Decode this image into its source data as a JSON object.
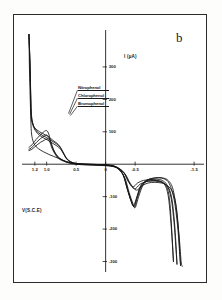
{
  "figure": {
    "panel_letter": "b",
    "caption_x": "V(S.C.E)",
    "caption_y": "I (µA)"
  },
  "legend": {
    "items": [
      {
        "label": "Nitrophenol"
      },
      {
        "label": "Chlorophenol"
      },
      {
        "label": "Bromophenol"
      }
    ]
  },
  "chart_data": {
    "type": "line",
    "title": "b",
    "xlabel": "V(S.C.E)",
    "ylabel": "I (µA)",
    "xlim": [
      1.35,
      -1.6
    ],
    "ylim": [
      -320,
      420
    ],
    "grid": false,
    "legend_position": "inside-left",
    "x_ticks": [
      {
        "value": 1.2,
        "label": "1.2"
      },
      {
        "value": 1.0,
        "label": "1.0"
      },
      {
        "value": 0.5,
        "label": "0.5"
      },
      {
        "value": 0.0,
        "label": "0"
      },
      {
        "value": -0.5,
        "label": "-0.5"
      },
      {
        "value": -1.5,
        "label": "-1.5"
      }
    ],
    "y_ticks": [
      {
        "value": 300,
        "label": "300"
      },
      {
        "value": 200,
        "label": "200"
      },
      {
        "value": 100,
        "label": "100"
      },
      {
        "value": -100,
        "label": "-100"
      },
      {
        "value": -200,
        "label": "-200"
      },
      {
        "value": -300,
        "label": "-300"
      }
    ],
    "series": [
      {
        "name": "Nitrophenol",
        "points": [
          [
            1.3,
            400
          ],
          [
            1.28,
            300
          ],
          [
            1.27,
            215
          ],
          [
            1.26,
            160
          ],
          [
            1.24,
            130
          ],
          [
            1.2,
            112
          ],
          [
            1.12,
            100
          ],
          [
            1.02,
            90
          ],
          [
            0.95,
            82
          ],
          [
            0.88,
            72
          ],
          [
            0.82,
            64
          ],
          [
            0.78,
            56
          ],
          [
            0.74,
            44
          ],
          [
            0.7,
            30
          ],
          [
            0.66,
            18
          ],
          [
            0.6,
            8
          ],
          [
            0.5,
            2
          ],
          [
            0.35,
            0
          ],
          [
            0.15,
            -1
          ],
          [
            0.0,
            -2
          ],
          [
            -0.15,
            -6
          ],
          [
            -0.28,
            -26
          ],
          [
            -0.36,
            -72
          ],
          [
            -0.42,
            -108
          ],
          [
            -0.47,
            -128
          ],
          [
            -0.52,
            -106
          ],
          [
            -0.58,
            -72
          ],
          [
            -0.64,
            -58
          ],
          [
            -0.72,
            -52
          ],
          [
            -0.82,
            -50
          ],
          [
            -0.92,
            -52
          ],
          [
            -1.0,
            -62
          ],
          [
            -1.06,
            -96
          ],
          [
            -1.1,
            -165
          ],
          [
            -1.13,
            -240
          ],
          [
            -1.15,
            -300
          ]
        ]
      },
      {
        "name": "Chlorophenol",
        "points": [
          [
            1.3,
            400
          ],
          [
            1.28,
            295
          ],
          [
            1.27,
            205
          ],
          [
            1.26,
            150
          ],
          [
            1.23,
            122
          ],
          [
            1.18,
            104
          ],
          [
            1.1,
            92
          ],
          [
            1.0,
            82
          ],
          [
            0.93,
            74
          ],
          [
            0.86,
            66
          ],
          [
            0.8,
            58
          ],
          [
            0.76,
            48
          ],
          [
            0.72,
            36
          ],
          [
            0.68,
            22
          ],
          [
            0.63,
            12
          ],
          [
            0.56,
            5
          ],
          [
            0.46,
            1
          ],
          [
            0.32,
            0
          ],
          [
            0.12,
            -1
          ],
          [
            0.0,
            -2
          ],
          [
            -0.16,
            -8
          ],
          [
            -0.29,
            -30
          ],
          [
            -0.37,
            -78
          ],
          [
            -0.43,
            -112
          ],
          [
            -0.48,
            -130
          ],
          [
            -0.53,
            -104
          ],
          [
            -0.59,
            -70
          ],
          [
            -0.66,
            -54
          ],
          [
            -0.75,
            -48
          ],
          [
            -0.86,
            -46
          ],
          [
            -0.96,
            -50
          ],
          [
            -1.04,
            -64
          ],
          [
            -1.11,
            -104
          ],
          [
            -1.16,
            -180
          ],
          [
            -1.19,
            -255
          ],
          [
            -1.21,
            -308
          ]
        ]
      },
      {
        "name": "Bromophenol",
        "points": [
          [
            1.3,
            400
          ],
          [
            1.28,
            288
          ],
          [
            1.27,
            196
          ],
          [
            1.26,
            142
          ],
          [
            1.22,
            114
          ],
          [
            1.16,
            96
          ],
          [
            1.08,
            84
          ],
          [
            0.98,
            74
          ],
          [
            0.91,
            66
          ],
          [
            0.84,
            58
          ],
          [
            0.78,
            50
          ],
          [
            0.74,
            40
          ],
          [
            0.7,
            28
          ],
          [
            0.66,
            16
          ],
          [
            0.61,
            8
          ],
          [
            0.54,
            3
          ],
          [
            0.44,
            0
          ],
          [
            0.3,
            -1
          ],
          [
            0.1,
            -2
          ],
          [
            0.0,
            -3
          ],
          [
            -0.18,
            -10
          ],
          [
            -0.3,
            -34
          ],
          [
            -0.38,
            -82
          ],
          [
            -0.44,
            -116
          ],
          [
            -0.49,
            -132
          ],
          [
            -0.54,
            -102
          ],
          [
            -0.61,
            -68
          ],
          [
            -0.69,
            -50
          ],
          [
            -0.79,
            -44
          ],
          [
            -0.9,
            -42
          ],
          [
            -1.0,
            -46
          ],
          [
            -1.08,
            -60
          ],
          [
            -1.16,
            -108
          ],
          [
            -1.22,
            -190
          ],
          [
            -1.25,
            -262
          ],
          [
            -1.27,
            -312
          ]
        ]
      },
      {
        "name": "Nitrophenol-return",
        "points": [
          [
            -1.15,
            -300
          ],
          [
            -1.12,
            -200
          ],
          [
            -1.09,
            -120
          ],
          [
            -1.05,
            -76
          ],
          [
            -0.98,
            -58
          ],
          [
            -0.88,
            -50
          ],
          [
            -0.76,
            -48
          ],
          [
            -0.64,
            -50
          ],
          [
            -0.54,
            -58
          ],
          [
            -0.46,
            -70
          ],
          [
            -0.38,
            -52
          ],
          [
            -0.3,
            -24
          ],
          [
            -0.18,
            -8
          ],
          [
            -0.05,
            -3
          ],
          [
            0.08,
            -2
          ],
          [
            0.22,
            -1
          ],
          [
            0.38,
            0
          ],
          [
            0.52,
            2
          ],
          [
            0.64,
            6
          ],
          [
            0.74,
            14
          ],
          [
            0.82,
            26
          ],
          [
            0.88,
            44
          ],
          [
            0.93,
            70
          ],
          [
            0.97,
            96
          ],
          [
            1.01,
            104
          ],
          [
            1.06,
            98
          ],
          [
            1.12,
            88
          ],
          [
            1.18,
            76
          ],
          [
            1.23,
            64
          ],
          [
            1.27,
            56
          ],
          [
            1.3,
            52
          ]
        ]
      },
      {
        "name": "Chlorophenol-return",
        "points": [
          [
            -1.21,
            -308
          ],
          [
            -1.18,
            -210
          ],
          [
            -1.14,
            -128
          ],
          [
            -1.09,
            -82
          ],
          [
            -1.01,
            -62
          ],
          [
            -0.91,
            -54
          ],
          [
            -0.79,
            -52
          ],
          [
            -0.68,
            -54
          ],
          [
            -0.58,
            -62
          ],
          [
            -0.49,
            -76
          ],
          [
            -0.4,
            -56
          ],
          [
            -0.31,
            -26
          ],
          [
            -0.19,
            -10
          ],
          [
            -0.06,
            -4
          ],
          [
            0.07,
            -3
          ],
          [
            0.21,
            -2
          ],
          [
            0.37,
            -1
          ],
          [
            0.51,
            1
          ],
          [
            0.63,
            5
          ],
          [
            0.73,
            12
          ],
          [
            0.81,
            22
          ],
          [
            0.87,
            38
          ],
          [
            0.92,
            60
          ],
          [
            0.96,
            82
          ],
          [
            1.0,
            90
          ],
          [
            1.05,
            86
          ],
          [
            1.11,
            78
          ],
          [
            1.17,
            68
          ],
          [
            1.22,
            58
          ],
          [
            1.26,
            50
          ],
          [
            1.3,
            46
          ]
        ]
      },
      {
        "name": "Bromophenol-return",
        "points": [
          [
            -1.27,
            -312
          ],
          [
            -1.24,
            -216
          ],
          [
            -1.2,
            -134
          ],
          [
            -1.14,
            -88
          ],
          [
            -1.05,
            -66
          ],
          [
            -0.95,
            -58
          ],
          [
            -0.83,
            -56
          ],
          [
            -0.72,
            -58
          ],
          [
            -0.62,
            -66
          ],
          [
            -0.52,
            -80
          ],
          [
            -0.42,
            -60
          ],
          [
            -0.33,
            -30
          ],
          [
            -0.21,
            -12
          ],
          [
            -0.08,
            -6
          ],
          [
            0.06,
            -4
          ],
          [
            0.2,
            -3
          ],
          [
            0.36,
            -2
          ],
          [
            0.5,
            0
          ],
          [
            0.62,
            4
          ],
          [
            0.72,
            10
          ],
          [
            0.8,
            18
          ],
          [
            0.86,
            32
          ],
          [
            0.91,
            50
          ],
          [
            0.95,
            70
          ],
          [
            0.99,
            78
          ],
          [
            1.04,
            74
          ],
          [
            1.1,
            68
          ],
          [
            1.16,
            60
          ],
          [
            1.21,
            52
          ],
          [
            1.25,
            46
          ],
          [
            1.3,
            42
          ]
        ]
      },
      {
        "name": "baseline-lower-sweep",
        "points": [
          [
            1.3,
            400
          ],
          [
            1.29,
            280
          ],
          [
            1.275,
            180
          ],
          [
            1.265,
            120
          ],
          [
            1.25,
            86
          ],
          [
            1.21,
            62
          ],
          [
            1.14,
            48
          ],
          [
            1.05,
            38
          ],
          [
            0.96,
            30
          ],
          [
            0.88,
            24
          ],
          [
            0.8,
            18
          ],
          [
            0.72,
            12
          ],
          [
            0.64,
            7
          ],
          [
            0.54,
            3
          ],
          [
            0.42,
            1
          ],
          [
            0.28,
            0
          ],
          [
            0.1,
            -1
          ],
          [
            -0.05,
            -3
          ],
          [
            -0.2,
            -12
          ],
          [
            -0.32,
            -40
          ],
          [
            -0.4,
            -88
          ],
          [
            -0.46,
            -120
          ],
          [
            -0.5,
            -134
          ],
          [
            -0.56,
            -100
          ],
          [
            -0.63,
            -66
          ],
          [
            -0.72,
            -48
          ],
          [
            -0.84,
            -42
          ],
          [
            -0.96,
            -42
          ],
          [
            -1.06,
            -50
          ],
          [
            -1.14,
            -76
          ],
          [
            -1.2,
            -140
          ],
          [
            -1.25,
            -230
          ],
          [
            -1.28,
            -300
          ],
          [
            -1.3,
            -315
          ]
        ]
      }
    ]
  }
}
